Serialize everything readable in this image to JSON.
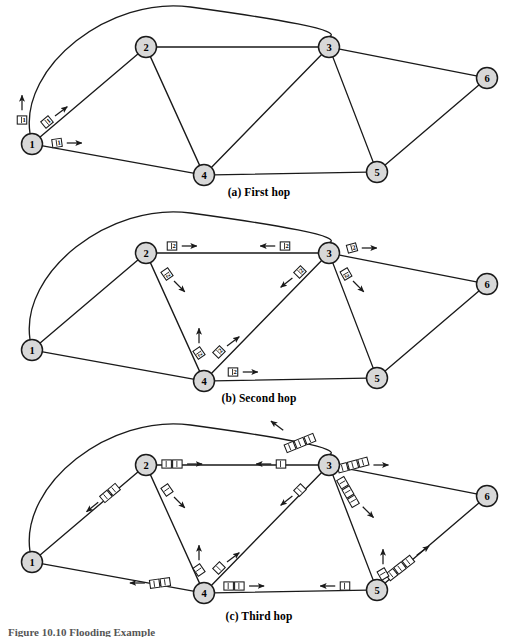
{
  "figure": {
    "caption_partial": "Figure 10.10   Flooding Example",
    "background": "#ffffff",
    "line_color": "#1a1a1a",
    "node_fill": "#d8d8d8",
    "node_stroke": "#1a1a1a",
    "packet_fill": "#ffffff",
    "packet_stroke": "#1a1a1a"
  },
  "panels": [
    {
      "id": "a",
      "caption": "(a) First hop",
      "y_offset": 0,
      "nodes": [
        {
          "id": "1",
          "label": "1",
          "x": 32,
          "y": 144
        },
        {
          "id": "2",
          "label": "2",
          "x": 146,
          "y": 47
        },
        {
          "id": "3",
          "label": "3",
          "x": 329,
          "y": 47
        },
        {
          "id": "4",
          "label": "4",
          "x": 204,
          "y": 175
        },
        {
          "id": "5",
          "label": "5",
          "x": 377,
          "y": 172
        },
        {
          "id": "6",
          "label": "6",
          "x": 487,
          "y": 78
        }
      ],
      "packets": [
        {
          "label": "1",
          "x": 22,
          "y": 120,
          "rot": 0,
          "count": 1,
          "arrow": "up"
        },
        {
          "label": "1",
          "x": 47,
          "y": 122,
          "rot": -40,
          "count": 1,
          "arrow": "upright"
        },
        {
          "label": "1",
          "x": 57,
          "y": 143,
          "rot": -8,
          "count": 1,
          "arrow": "right"
        }
      ]
    },
    {
      "id": "b",
      "caption": "(b) Second hop",
      "y_offset": 206,
      "nodes": [
        {
          "id": "1",
          "label": "1",
          "x": 32,
          "y": 350
        },
        {
          "id": "2",
          "label": "2",
          "x": 146,
          "y": 253
        },
        {
          "id": "3",
          "label": "3",
          "x": 329,
          "y": 253
        },
        {
          "id": "4",
          "label": "4",
          "x": 204,
          "y": 381
        },
        {
          "id": "5",
          "label": "5",
          "x": 377,
          "y": 378
        },
        {
          "id": "6",
          "label": "6",
          "x": 487,
          "y": 284
        }
      ],
      "packets": [
        {
          "label": "2",
          "x": 172,
          "y": 246,
          "rot": 0,
          "count": 1,
          "arrow": "right"
        },
        {
          "label": "2",
          "x": 285,
          "y": 246,
          "rot": 0,
          "count": 1,
          "arrow": "left"
        },
        {
          "label": "2",
          "x": 352,
          "y": 248,
          "rot": -15,
          "count": 1,
          "arrow": "right"
        },
        {
          "label": "2",
          "x": 167,
          "y": 274,
          "rot": 55,
          "count": 1,
          "arrow": "downright"
        },
        {
          "label": "2",
          "x": 300,
          "y": 272,
          "rot": -45,
          "count": 1,
          "arrow": "downleft"
        },
        {
          "label": "2",
          "x": 346,
          "y": 274,
          "rot": 60,
          "count": 1,
          "arrow": "downright"
        },
        {
          "label": "2",
          "x": 199,
          "y": 353,
          "rot": 55,
          "count": 1,
          "arrow": "up"
        },
        {
          "label": "2",
          "x": 219,
          "y": 352,
          "rot": -45,
          "count": 1,
          "arrow": "upright"
        },
        {
          "label": "2",
          "x": 233,
          "y": 372,
          "rot": 0,
          "count": 1,
          "arrow": "right"
        }
      ]
    },
    {
      "id": "c",
      "caption": "(c) Third hop",
      "y_offset": 418,
      "nodes": [
        {
          "id": "1",
          "label": "1",
          "x": 32,
          "y": 562
        },
        {
          "id": "2",
          "label": "2",
          "x": 146,
          "y": 465
        },
        {
          "id": "3",
          "label": "3",
          "x": 329,
          "y": 465
        },
        {
          "id": "4",
          "label": "4",
          "x": 204,
          "y": 593
        },
        {
          "id": "5",
          "label": "5",
          "x": 377,
          "y": 590
        },
        {
          "id": "6",
          "label": "6",
          "x": 487,
          "y": 496
        }
      ],
      "packets": [
        {
          "label": "",
          "x": 172,
          "y": 464,
          "rot": 0,
          "count": 2,
          "arrow": "right"
        },
        {
          "label": "",
          "x": 281,
          "y": 464,
          "rot": 0,
          "count": 1,
          "arrow": "left"
        },
        {
          "label": "",
          "x": 300,
          "y": 443,
          "rot": -22,
          "count": 3,
          "arrow": "upleft"
        },
        {
          "label": "",
          "x": 353,
          "y": 465,
          "rot": -15,
          "count": 3,
          "arrow": "right"
        },
        {
          "label": "",
          "x": 110,
          "y": 493,
          "rot": -40,
          "count": 2,
          "arrow": "downleft"
        },
        {
          "label": "",
          "x": 167,
          "y": 490,
          "rot": 55,
          "count": 1,
          "arrow": "downright"
        },
        {
          "label": "",
          "x": 300,
          "y": 490,
          "rot": -45,
          "count": 1,
          "arrow": "downleft"
        },
        {
          "label": "",
          "x": 348,
          "y": 492,
          "rot": 60,
          "count": 3,
          "arrow": "downright"
        },
        {
          "label": "",
          "x": 199,
          "y": 570,
          "rot": 55,
          "count": 1,
          "arrow": "up"
        },
        {
          "label": "",
          "x": 219,
          "y": 568,
          "rot": -45,
          "count": 1,
          "arrow": "upright"
        },
        {
          "label": "",
          "x": 160,
          "y": 583,
          "rot": -8,
          "count": 2,
          "arrow": "left"
        },
        {
          "label": "",
          "x": 234,
          "y": 586,
          "rot": 0,
          "count": 2,
          "arrow": "right"
        },
        {
          "label": "",
          "x": 345,
          "y": 586,
          "rot": 0,
          "count": 1,
          "arrow": "left"
        },
        {
          "label": "",
          "x": 400,
          "y": 568,
          "rot": -38,
          "count": 3,
          "arrow": "upright"
        },
        {
          "label": "",
          "x": 383,
          "y": 574,
          "rot": 60,
          "count": 1,
          "arrow": "up"
        }
      ]
    }
  ],
  "edges": [
    {
      "from": "1",
      "to": "3",
      "type": "arc"
    },
    {
      "from": "1",
      "to": "2",
      "type": "line"
    },
    {
      "from": "1",
      "to": "4",
      "type": "line"
    },
    {
      "from": "2",
      "to": "3",
      "type": "line"
    },
    {
      "from": "2",
      "to": "4",
      "type": "line"
    },
    {
      "from": "3",
      "to": "4",
      "type": "line"
    },
    {
      "from": "3",
      "to": "5",
      "type": "line"
    },
    {
      "from": "3",
      "to": "6",
      "type": "line"
    },
    {
      "from": "4",
      "to": "5",
      "type": "line"
    },
    {
      "from": "5",
      "to": "6",
      "type": "line"
    }
  ]
}
